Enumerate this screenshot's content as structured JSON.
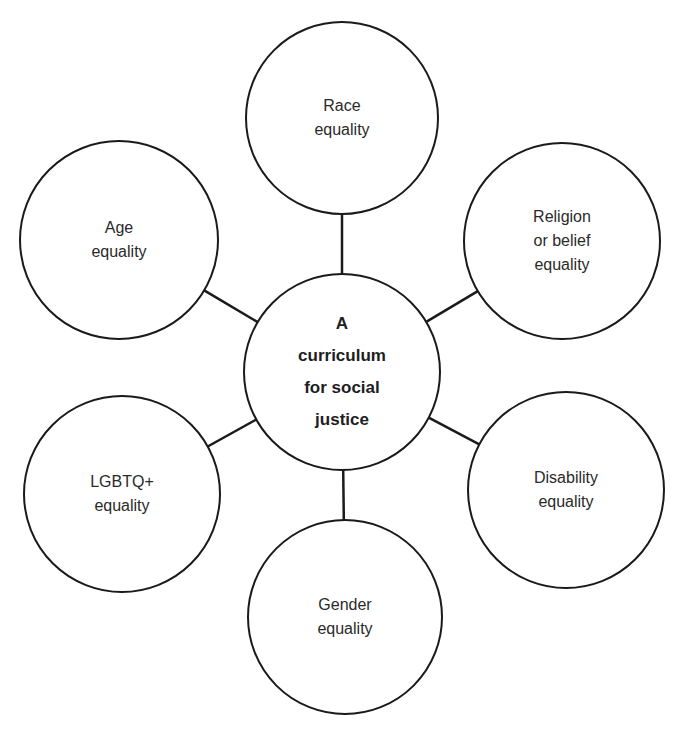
{
  "diagram": {
    "type": "hub-and-spoke",
    "stroke_color": "#1a1a1a",
    "background": "#ffffff",
    "center": {
      "id": "center",
      "lines": [
        "A",
        "curriculum",
        "for social",
        "justice"
      ],
      "cx": 342,
      "cy": 372,
      "r": 98
    },
    "nodes": [
      {
        "id": "race",
        "lines": [
          "Race",
          "equality"
        ],
        "cx": 342,
        "cy": 118,
        "r": 96
      },
      {
        "id": "religion",
        "lines": [
          "Religion",
          "or belief",
          "equality"
        ],
        "cx": 562,
        "cy": 241,
        "r": 98
      },
      {
        "id": "disability",
        "lines": [
          "Disability",
          "equality"
        ],
        "cx": 566,
        "cy": 490,
        "r": 98
      },
      {
        "id": "gender",
        "lines": [
          "Gender",
          "equality"
        ],
        "cx": 345,
        "cy": 617,
        "r": 97
      },
      {
        "id": "lgbtq",
        "lines": [
          "LGBTQ+",
          "equality"
        ],
        "cx": 122,
        "cy": 494,
        "r": 98
      },
      {
        "id": "age",
        "lines": [
          "Age",
          "equality"
        ],
        "cx": 119,
        "cy": 240,
        "r": 99
      }
    ]
  },
  "labels": {
    "center": "A curriculum for social justice",
    "race": "Race equality",
    "religion": "Religion or belief equality",
    "disability": "Disability equality",
    "gender": "Gender equality",
    "lgbtq": "LGBTQ+ equality",
    "age": "Age equality"
  }
}
